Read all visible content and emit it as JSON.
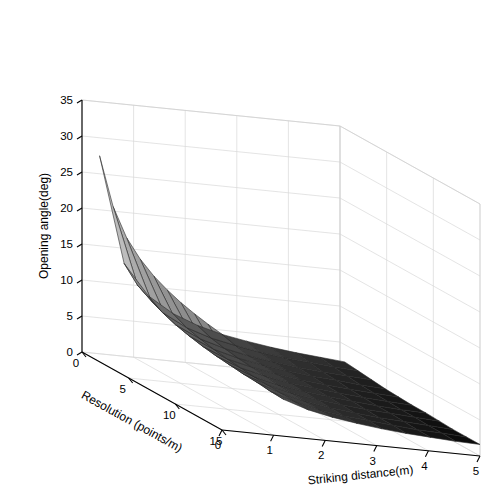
{
  "figure": {
    "background": "#ffffff",
    "type": "matlab-surface-3d"
  },
  "chart_data": {
    "type": "surface",
    "title": "",
    "xlabel": "Resolution (points/m)",
    "ylabel": "Striking distance(m)",
    "zlabel": "Opening angle(deg)",
    "xlim": [
      0,
      15
    ],
    "ylim": [
      0,
      5
    ],
    "zlim": [
      0,
      35
    ],
    "xticks": [
      0,
      5,
      10,
      15
    ],
    "yticks": [
      0,
      1,
      2,
      3,
      4,
      5
    ],
    "zticks": [
      0,
      5,
      10,
      15,
      20,
      25,
      30,
      35
    ],
    "xtick_labels": [
      "0",
      "5",
      "10",
      "15"
    ],
    "ytick_labels": [
      "0",
      "1",
      "2",
      "3",
      "4",
      "5"
    ],
    "ztick_labels": [
      "0",
      "5",
      "10",
      "15",
      "20",
      "25",
      "30",
      "35"
    ],
    "grid": true,
    "legend": null,
    "colormap": "gray",
    "colormap_stops": [
      "#050505",
      "#3a3a3a",
      "#6e6e6e",
      "#9d9d9d",
      "#c4c4c4",
      "#dcdcdc"
    ],
    "mesh_edge_color": "#2a2a2a",
    "view": {
      "azimuth": -37.5,
      "elevation": 30
    },
    "x": [
      0.5,
      1.95,
      3.4,
      4.85,
      6.3,
      7.75,
      9.2,
      10.65,
      12.1,
      13.55,
      15.0
    ],
    "y": [
      0.25,
      0.725,
      1.2,
      1.675,
      2.15,
      2.625,
      3.1,
      3.575,
      4.05,
      4.525,
      5.0
    ],
    "z": [
      [
        27.8,
        13.2,
        9.0,
        6.9,
        5.6,
        4.7,
        4.1,
        3.6,
        3.2,
        2.9,
        2.6
      ],
      [
        21.8,
        11.2,
        7.8,
        6.0,
        4.9,
        4.2,
        3.6,
        3.2,
        2.9,
        2.6,
        2.4
      ],
      [
        18.5,
        10.1,
        7.1,
        5.5,
        4.5,
        3.8,
        3.3,
        2.9,
        2.6,
        2.4,
        2.2
      ],
      [
        16.6,
        9.3,
        6.6,
        5.1,
        4.2,
        3.6,
        3.1,
        2.7,
        2.5,
        2.2,
        2.0
      ],
      [
        15.3,
        8.8,
        6.2,
        4.8,
        4.0,
        3.4,
        2.9,
        2.6,
        2.3,
        2.1,
        1.9
      ],
      [
        14.4,
        8.4,
        5.9,
        4.6,
        3.8,
        3.2,
        2.8,
        2.5,
        2.2,
        2.0,
        1.8
      ],
      [
        13.7,
        8.0,
        5.7,
        4.4,
        3.6,
        3.1,
        2.7,
        2.4,
        2.1,
        1.9,
        1.8
      ],
      [
        13.2,
        7.8,
        5.5,
        4.3,
        3.5,
        3.0,
        2.6,
        2.3,
        2.1,
        1.9,
        1.7
      ],
      [
        12.8,
        7.6,
        5.4,
        4.2,
        3.4,
        2.9,
        2.5,
        2.2,
        2.0,
        1.8,
        1.6
      ],
      [
        12.5,
        7.4,
        5.2,
        4.1,
        3.3,
        2.8,
        2.5,
        2.2,
        1.9,
        1.8,
        1.6
      ],
      [
        12.2,
        7.2,
        5.1,
        4.0,
        3.3,
        2.8,
        2.4,
        2.1,
        1.9,
        1.7,
        1.6
      ]
    ]
  }
}
